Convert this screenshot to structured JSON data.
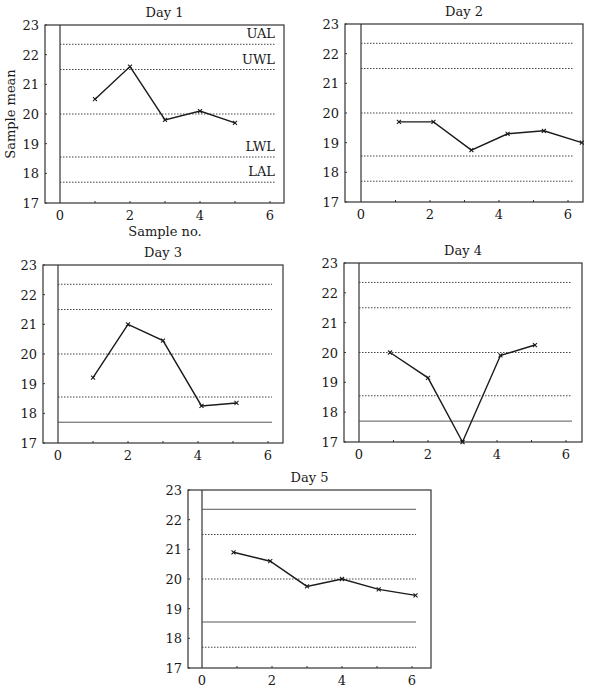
{
  "chart_data": [
    {
      "type": "line",
      "title": "Day 1",
      "xlabel": "Sample no.",
      "ylabel": "Sample mean",
      "x": [
        1,
        2,
        3,
        4,
        5
      ],
      "values": [
        20.5,
        21.6,
        19.8,
        20.1,
        19.7
      ],
      "xlim": [
        0,
        6
      ],
      "ylim": [
        17,
        23
      ],
      "xticks": [
        0,
        2,
        4,
        6
      ],
      "yticks": [
        17,
        18,
        19,
        20,
        21,
        22,
        23
      ],
      "limits": [
        {
          "name": "UAL",
          "value": 22.35,
          "style": "dotted",
          "label": "UAL"
        },
        {
          "name": "UWL",
          "value": 21.5,
          "style": "dotted",
          "label": "UWL"
        },
        {
          "name": "Target",
          "value": 20.0,
          "style": "dotted",
          "label": ""
        },
        {
          "name": "LWL",
          "value": 18.55,
          "style": "dotted",
          "label": "LWL"
        },
        {
          "name": "LAL",
          "value": 17.7,
          "style": "dotted",
          "label": "LAL"
        }
      ],
      "frame": {
        "left": 45,
        "x0": 60,
        "right": 284,
        "top": 25,
        "bottom": 203,
        "xunit": 35,
        "line_end": 275
      }
    },
    {
      "type": "line",
      "title": "Day 2",
      "xlabel": "",
      "ylabel": "",
      "x": [
        1.1,
        2.1,
        3.2,
        4.25,
        5.3,
        6.4
      ],
      "values": [
        19.7,
        19.7,
        18.75,
        19.3,
        19.4,
        19.0
      ],
      "xlim": [
        0,
        6
      ],
      "ylim": [
        17,
        23
      ],
      "xticks": [
        0,
        2,
        4,
        6
      ],
      "yticks": [
        17,
        18,
        19,
        20,
        21,
        22,
        23
      ],
      "limits": [
        {
          "name": "UAL",
          "value": 22.35,
          "style": "dotted",
          "label": ""
        },
        {
          "name": "UWL",
          "value": 21.5,
          "style": "dotted",
          "label": ""
        },
        {
          "name": "Target",
          "value": 20.0,
          "style": "dotted",
          "label": ""
        },
        {
          "name": "LWL",
          "value": 18.55,
          "style": "dotted",
          "label": ""
        },
        {
          "name": "LAL",
          "value": 17.7,
          "style": "dotted",
          "label": ""
        }
      ],
      "frame": {
        "left": 345,
        "x0": 361,
        "right": 583,
        "top": 24,
        "bottom": 202,
        "xunit": 34.5,
        "line_end": 574
      }
    },
    {
      "type": "line",
      "title": "Day 3",
      "xlabel": "",
      "ylabel": "",
      "x": [
        1,
        2,
        3,
        4.1,
        5.1
      ],
      "values": [
        19.2,
        21.0,
        20.45,
        18.25,
        18.35
      ],
      "xlim": [
        0,
        6
      ],
      "ylim": [
        17,
        23
      ],
      "xticks": [
        0,
        2,
        4,
        6
      ],
      "yticks": [
        17,
        18,
        19,
        20,
        21,
        22,
        23
      ],
      "limits": [
        {
          "name": "UAL",
          "value": 22.35,
          "style": "dotted",
          "label": ""
        },
        {
          "name": "UWL",
          "value": 21.5,
          "style": "dotted",
          "label": ""
        },
        {
          "name": "Target",
          "value": 20.0,
          "style": "dotted",
          "label": ""
        },
        {
          "name": "LWL",
          "value": 18.55,
          "style": "dotted",
          "label": ""
        },
        {
          "name": "LAL",
          "value": 17.7,
          "style": "solid",
          "label": ""
        }
      ],
      "frame": {
        "left": 43,
        "x0": 58,
        "right": 283,
        "top": 265,
        "bottom": 443,
        "xunit": 35,
        "line_end": 272
      }
    },
    {
      "type": "line",
      "title": "Day 4",
      "xlabel": "",
      "ylabel": "",
      "x": [
        0.9,
        2,
        3,
        4.1,
        5.1
      ],
      "values": [
        20.0,
        19.15,
        17.0,
        19.9,
        20.25
      ],
      "xlim": [
        0,
        6
      ],
      "ylim": [
        17,
        23
      ],
      "xticks": [
        0,
        2,
        4,
        6
      ],
      "yticks": [
        17,
        18,
        19,
        20,
        21,
        22,
        23
      ],
      "limits": [
        {
          "name": "UAL",
          "value": 22.35,
          "style": "dotted",
          "label": ""
        },
        {
          "name": "UWL",
          "value": 21.5,
          "style": "dotted",
          "label": ""
        },
        {
          "name": "Target",
          "value": 20.0,
          "style": "dotted",
          "label": ""
        },
        {
          "name": "LWL",
          "value": 18.55,
          "style": "dotted",
          "label": ""
        },
        {
          "name": "LAL",
          "value": 17.7,
          "style": "solid",
          "label": ""
        }
      ],
      "frame": {
        "left": 344,
        "x0": 359,
        "right": 582,
        "top": 263,
        "bottom": 442,
        "xunit": 34.5,
        "line_end": 572
      }
    },
    {
      "type": "line",
      "title": "Day 5",
      "xlabel": "",
      "ylabel": "",
      "x": [
        0.9,
        1.95,
        3,
        4,
        5.05,
        6.1
      ],
      "values": [
        20.9,
        20.6,
        19.75,
        20.0,
        19.65,
        19.45
      ],
      "xlim": [
        0,
        6
      ],
      "ylim": [
        17,
        23
      ],
      "xticks": [
        0,
        2,
        4,
        6
      ],
      "yticks": [
        17,
        18,
        19,
        20,
        21,
        22,
        23
      ],
      "limits": [
        {
          "name": "UAL",
          "value": 22.35,
          "style": "solid",
          "label": ""
        },
        {
          "name": "UWL",
          "value": 21.5,
          "style": "dotted",
          "label": ""
        },
        {
          "name": "Target",
          "value": 20.0,
          "style": "dotted",
          "label": ""
        },
        {
          "name": "LWL",
          "value": 18.55,
          "style": "solid",
          "label": ""
        },
        {
          "name": "LAL",
          "value": 17.7,
          "style": "dotted",
          "label": ""
        }
      ],
      "frame": {
        "left": 188,
        "x0": 202,
        "right": 431,
        "top": 490,
        "bottom": 668,
        "xunit": 35,
        "line_end": 416
      }
    }
  ],
  "colors": {
    "ink": "#1a1a1a",
    "frame": "#333333",
    "dotted": "#444444",
    "background": "#ffffff"
  }
}
